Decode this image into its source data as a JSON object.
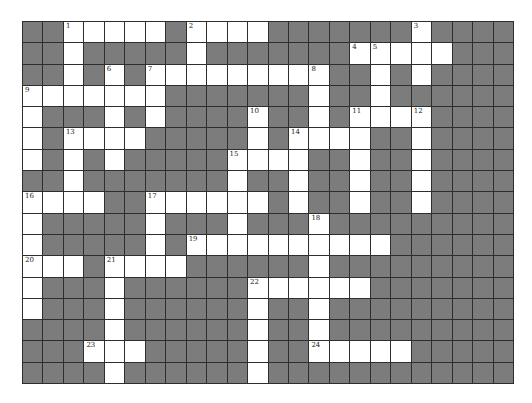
{
  "puzzle": {
    "type": "crossword",
    "columns": 24,
    "rows": 17,
    "colors": {
      "block": "#7c7c7c",
      "open": "#ffffff",
      "gridline": "#2e2e2e",
      "number": "#222222"
    },
    "layout": [
      "##WWWWW#WWWW#######W####",
      "##W#####W#######WWWWW###",
      "##W#W#WWWWWWWWW##W#W####",
      "WWWWWWW#######W##W######",
      "W###W#W####W##W#WWWW####",
      "W#WWWW#####W#WWWW##W####",
      "W#W#W#####WWWW##W##W####",
      "##W#######W##W##W##W####",
      "WWWW##WWWWWW#W##W##W####",
      "W#####W###W###W#########",
      "W#####W#WWWWWWWWWW######",
      "WWW#WWWW######W#########",
      "W###W######WWWWWW#######",
      "W###W######W##W#########",
      "####W######W##W#########",
      "###WWW#####W##WWWWW#####",
      "####W######W############"
    ],
    "numbers": [
      {
        "n": "1",
        "row": 0,
        "col": 2
      },
      {
        "n": "2",
        "row": 0,
        "col": 8
      },
      {
        "n": "3",
        "row": 0,
        "col": 19
      },
      {
        "n": "4",
        "row": 1,
        "col": 16
      },
      {
        "n": "5",
        "row": 1,
        "col": 17
      },
      {
        "n": "6",
        "row": 2,
        "col": 4
      },
      {
        "n": "7",
        "row": 2,
        "col": 6
      },
      {
        "n": "8",
        "row": 2,
        "col": 14
      },
      {
        "n": "9",
        "row": 3,
        "col": 0
      },
      {
        "n": "10",
        "row": 4,
        "col": 11
      },
      {
        "n": "11",
        "row": 4,
        "col": 16
      },
      {
        "n": "12",
        "row": 4,
        "col": 19
      },
      {
        "n": "13",
        "row": 5,
        "col": 2
      },
      {
        "n": "14",
        "row": 5,
        "col": 13
      },
      {
        "n": "15",
        "row": 6,
        "col": 10
      },
      {
        "n": "16",
        "row": 8,
        "col": 0
      },
      {
        "n": "17",
        "row": 8,
        "col": 6
      },
      {
        "n": "18",
        "row": 9,
        "col": 14
      },
      {
        "n": "19",
        "row": 10,
        "col": 8
      },
      {
        "n": "20",
        "row": 11,
        "col": 0
      },
      {
        "n": "21",
        "row": 11,
        "col": 4
      },
      {
        "n": "22",
        "row": 12,
        "col": 11
      },
      {
        "n": "23",
        "row": 15,
        "col": 3
      },
      {
        "n": "24",
        "row": 15,
        "col": 14
      }
    ]
  }
}
